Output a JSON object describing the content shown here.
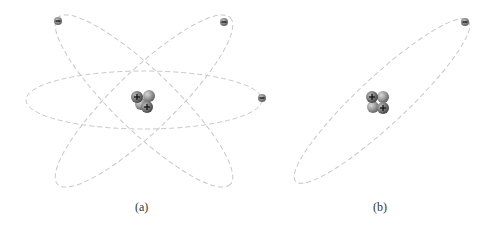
{
  "panels": [
    {
      "id": "a",
      "caption": "(a)",
      "description": "Atom model with three electrons on three elliptical orbits around a nucleus",
      "nucleus": {
        "protons": 2,
        "neutrons": 2,
        "proton_sign": "+"
      },
      "electrons": 3,
      "electron_sign": "−",
      "orbits": 3
    },
    {
      "id": "b",
      "caption": "(b)",
      "description": "Atom model with one electron on one elliptical orbit around a nucleus",
      "nucleus": {
        "protons": 2,
        "neutrons": 2,
        "proton_sign": "+"
      },
      "electrons": 1,
      "electron_sign": "−",
      "orbits": 1
    }
  ],
  "colors": {
    "orbit": "#c8c8c8",
    "particle": "#8a8a8a",
    "background": "#ffffff"
  }
}
